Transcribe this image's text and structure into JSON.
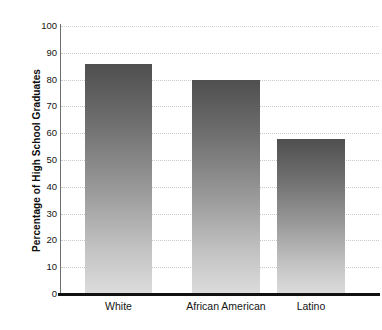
{
  "chart_data": {
    "type": "bar",
    "title": "",
    "xlabel": "",
    "ylabel": "Percentage of High School Graduates",
    "categories": [
      "White",
      "African American",
      "Latino"
    ],
    "values": [
      86,
      80,
      58
    ],
    "ylim": [
      0,
      100
    ],
    "ytick_labels": [
      "100",
      "90",
      "80",
      "70",
      "60",
      "50",
      "40",
      "30",
      "20",
      "10",
      "0"
    ],
    "ytick_values": [
      100,
      90,
      80,
      70,
      60,
      50,
      40,
      30,
      20,
      10,
      0
    ],
    "grid": "horizontal-dotted",
    "legend": "none",
    "bar_color_top": "#4f4f4f",
    "bar_color_bottom": "#dcdcdc",
    "axis_color": "#111111",
    "gridline_color": "#c9c9c9"
  }
}
